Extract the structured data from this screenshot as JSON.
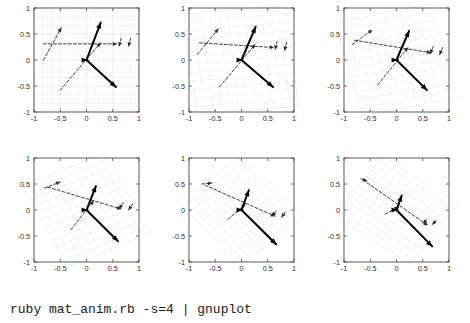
{
  "caption": {
    "command": "ruby mat_anim.rb -s=4 | gnuplot"
  },
  "figure": {
    "rows": 2,
    "cols": 3,
    "panel_count": 6
  },
  "chart_data": {
    "type": "scatter",
    "title": "",
    "subtitle": "",
    "xlabel": "",
    "ylabel": "",
    "xlim": [
      -1,
      1
    ],
    "ylim": [
      -1,
      1
    ],
    "xticks": [
      "-1",
      "-0.5",
      "0",
      "0.5",
      "1"
    ],
    "yticks": [
      "1",
      "0.5",
      "0",
      "-0.5",
      "-1"
    ],
    "xtick_values": [
      -1,
      -0.5,
      0,
      0.5,
      1
    ],
    "ytick_values": [
      1,
      0.5,
      0,
      -0.5,
      -1
    ],
    "grid": true,
    "legend": "none",
    "colors": {
      "vector_solid": "#000000",
      "vector_dashed": "#2a2a2a",
      "grid": "#b9b9b9",
      "frame": "#4a4a4a",
      "background": "#ffffff"
    },
    "panels": [
      {
        "index": 1,
        "frame": 0,
        "matrix": [
          [
            1.0,
            0.0
          ],
          [
            0.0,
            1.0
          ]
        ],
        "grid_rotation_deg": 0,
        "vectors_solid": [
          {
            "name": "v1",
            "from": [
              0.0,
              0.0
            ],
            "to": [
              0.27,
              0.72
            ]
          },
          {
            "name": "v2",
            "from": [
              0.0,
              0.0
            ],
            "to": [
              0.56,
              -0.52
            ]
          },
          {
            "name": "v3",
            "from": [
              0.0,
              0.0
            ],
            "to": [
              0.02,
              0.0
            ]
          }
        ],
        "vectors_dashed": [
          {
            "name": "d1",
            "from": [
              -0.82,
              0.0
            ],
            "to": [
              -0.48,
              0.62
            ]
          },
          {
            "name": "d2",
            "from": [
              -0.82,
              0.31
            ],
            "to": [
              0.58,
              0.31
            ]
          },
          {
            "name": "d3",
            "from": [
              -0.5,
              -0.58
            ],
            "to": [
              0.27,
              0.33
            ]
          },
          {
            "name": "d4",
            "from": [
              0.66,
              0.42
            ],
            "to": [
              0.62,
              0.26
            ]
          },
          {
            "name": "d5",
            "from": [
              0.84,
              0.42
            ],
            "to": [
              0.8,
              0.26
            ]
          }
        ]
      },
      {
        "index": 2,
        "frame": 1,
        "matrix": [
          [
            0.97,
            -0.12
          ],
          [
            0.08,
            0.97
          ]
        ],
        "grid_rotation_deg": -7,
        "vectors_solid": [
          {
            "name": "v1",
            "from": [
              0.0,
              0.0
            ],
            "to": [
              0.27,
              0.64
            ]
          },
          {
            "name": "v2",
            "from": [
              0.0,
              0.0
            ],
            "to": [
              0.6,
              -0.52
            ]
          },
          {
            "name": "v3",
            "from": [
              0.0,
              0.0
            ],
            "to": [
              0.02,
              0.0
            ]
          }
        ],
        "vectors_dashed": [
          {
            "name": "d1",
            "from": [
              -0.84,
              0.11
            ],
            "to": [
              -0.44,
              0.6
            ]
          },
          {
            "name": "d2",
            "from": [
              -0.8,
              0.33
            ],
            "to": [
              0.62,
              0.24
            ]
          },
          {
            "name": "d3",
            "from": [
              -0.42,
              -0.52
            ],
            "to": [
              0.26,
              0.3
            ]
          },
          {
            "name": "d4",
            "from": [
              0.68,
              0.36
            ],
            "to": [
              0.64,
              0.2
            ]
          },
          {
            "name": "d5",
            "from": [
              0.86,
              0.34
            ],
            "to": [
              0.82,
              0.18
            ]
          }
        ]
      },
      {
        "index": 3,
        "frame": 2,
        "matrix": [
          [
            0.9,
            -0.25
          ],
          [
            0.18,
            0.9
          ]
        ],
        "grid_rotation_deg": -15,
        "vectors_solid": [
          {
            "name": "v1",
            "from": [
              0.0,
              0.0
            ],
            "to": [
              0.24,
              0.56
            ]
          },
          {
            "name": "v2",
            "from": [
              0.0,
              0.0
            ],
            "to": [
              0.58,
              -0.58
            ]
          },
          {
            "name": "v3",
            "from": [
              0.0,
              0.0
            ],
            "to": [
              0.02,
              0.0
            ]
          }
        ],
        "vectors_dashed": [
          {
            "name": "d1",
            "from": [
              -0.84,
              0.3
            ],
            "to": [
              -0.46,
              0.58
            ]
          },
          {
            "name": "d2",
            "from": [
              -0.8,
              0.38
            ],
            "to": [
              0.66,
              0.14
            ]
          },
          {
            "name": "d3",
            "from": [
              -0.36,
              -0.48
            ],
            "to": [
              0.22,
              0.24
            ]
          },
          {
            "name": "d4",
            "from": [
              0.7,
              0.26
            ],
            "to": [
              0.64,
              0.12
            ]
          },
          {
            "name": "d5",
            "from": [
              0.88,
              0.24
            ],
            "to": [
              0.82,
              0.1
            ]
          }
        ]
      },
      {
        "index": 4,
        "frame": 3,
        "matrix": [
          [
            0.78,
            -0.42
          ],
          [
            0.32,
            0.78
          ]
        ],
        "grid_rotation_deg": -26,
        "vectors_solid": [
          {
            "name": "v1",
            "from": [
              0.0,
              0.0
            ],
            "to": [
              0.18,
              0.46
            ]
          },
          {
            "name": "v2",
            "from": [
              0.0,
              0.0
            ],
            "to": [
              0.6,
              -0.6
            ]
          },
          {
            "name": "v3",
            "from": [
              0.0,
              0.0
            ],
            "to": [
              0.02,
              0.0
            ]
          }
        ],
        "vectors_dashed": [
          {
            "name": "d1",
            "from": [
              -0.8,
              0.42
            ],
            "to": [
              -0.5,
              0.54
            ]
          },
          {
            "name": "d2",
            "from": [
              -0.74,
              0.44
            ],
            "to": [
              0.66,
              0.02
            ]
          },
          {
            "name": "d3",
            "from": [
              -0.3,
              -0.38
            ],
            "to": [
              0.14,
              0.18
            ]
          },
          {
            "name": "d4",
            "from": [
              0.7,
              0.14
            ],
            "to": [
              0.62,
              0.02
            ]
          },
          {
            "name": "d5",
            "from": [
              0.88,
              0.12
            ],
            "to": [
              0.8,
              0.0
            ]
          }
        ]
      },
      {
        "index": 5,
        "frame": 4,
        "matrix": [
          [
            0.62,
            -0.58
          ],
          [
            0.46,
            0.62
          ]
        ],
        "grid_rotation_deg": -38,
        "vectors_solid": [
          {
            "name": "v1",
            "from": [
              0.0,
              0.0
            ],
            "to": [
              0.14,
              0.38
            ]
          },
          {
            "name": "v2",
            "from": [
              0.0,
              0.0
            ],
            "to": [
              0.66,
              -0.66
            ]
          },
          {
            "name": "v3",
            "from": [
              0.0,
              0.0
            ],
            "to": [
              0.02,
              0.0
            ]
          }
        ],
        "vectors_dashed": [
          {
            "name": "d1",
            "from": [
              -0.76,
              0.5
            ],
            "to": [
              -0.56,
              0.52
            ]
          },
          {
            "name": "d2",
            "from": [
              -0.7,
              0.48
            ],
            "to": [
              0.64,
              -0.12
            ]
          },
          {
            "name": "d3",
            "from": [
              -0.26,
              -0.18
            ],
            "to": [
              0.08,
              0.12
            ]
          },
          {
            "name": "d4",
            "from": [
              0.66,
              -0.02
            ],
            "to": [
              0.58,
              -0.12
            ]
          },
          {
            "name": "d5",
            "from": [
              0.84,
              -0.04
            ],
            "to": [
              0.76,
              -0.14
            ]
          }
        ]
      },
      {
        "index": 6,
        "frame": 5,
        "matrix": [
          [
            0.46,
            -0.72
          ],
          [
            0.58,
            0.46
          ]
        ],
        "grid_rotation_deg": -50,
        "vectors_solid": [
          {
            "name": "v1",
            "from": [
              0.0,
              0.0
            ],
            "to": [
              0.1,
              0.28
            ]
          },
          {
            "name": "v2",
            "from": [
              0.0,
              0.0
            ],
            "to": [
              0.68,
              -0.7
            ]
          },
          {
            "name": "v3",
            "from": [
              0.0,
              0.0
            ],
            "to": [
              0.02,
              0.0
            ]
          }
        ],
        "vectors_dashed": [
          {
            "name": "d1",
            "from": [
              -0.68,
              0.6
            ],
            "to": [
              -0.56,
              0.56
            ]
          },
          {
            "name": "d2",
            "from": [
              -0.64,
              0.58
            ],
            "to": [
              0.6,
              -0.3
            ]
          },
          {
            "name": "d3",
            "from": [
              -0.22,
              -0.08
            ],
            "to": [
              0.04,
              0.06
            ]
          },
          {
            "name": "d4",
            "from": [
              0.58,
              -0.18
            ],
            "to": [
              0.5,
              -0.26
            ]
          },
          {
            "name": "d5",
            "from": [
              0.76,
              -0.2
            ],
            "to": [
              0.68,
              -0.28
            ]
          }
        ]
      }
    ]
  }
}
